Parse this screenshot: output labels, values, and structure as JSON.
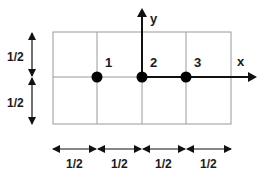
{
  "title_cut": "",
  "axes": {
    "x_label": "x",
    "y_label": "y"
  },
  "points": [
    {
      "label": "1"
    },
    {
      "label": "2"
    },
    {
      "label": "3"
    }
  ],
  "dimensions": {
    "vertical": [
      "1/2",
      "1/2"
    ],
    "horizontal": [
      "1/2",
      "1/2",
      "1/2",
      "1/2"
    ]
  },
  "colors": {
    "grid": "#9a9a9a",
    "axis": "#111111",
    "point": "#000000",
    "text": "#1a1a1a"
  }
}
